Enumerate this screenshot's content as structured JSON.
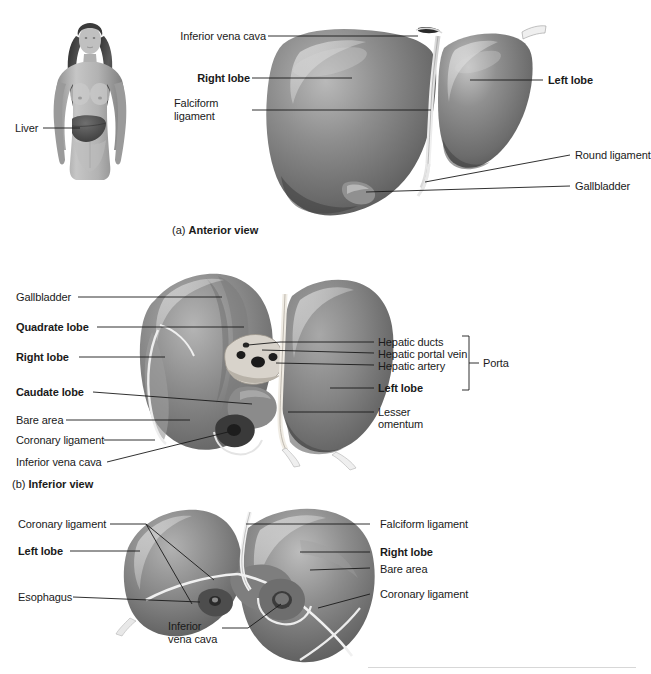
{
  "document": {
    "title": "Liver anatomy figure",
    "subject": "liver"
  },
  "panels": [
    {
      "id": "a",
      "caption_prefix": "(a)",
      "caption_title": "Anterior view",
      "orientation_figure": {
        "name": "human-body-silhouette",
        "label": "Liver"
      },
      "labels": [
        {
          "text": "Inferior vena cava",
          "bold": false,
          "align": "right"
        },
        {
          "text": "Right lobe",
          "bold": true,
          "align": "right"
        },
        {
          "text": "Falciform\nligament",
          "bold": false,
          "align": "left"
        },
        {
          "text": "Left lobe",
          "bold": true,
          "align": "left"
        },
        {
          "text": "Round ligament",
          "bold": false,
          "align": "left"
        },
        {
          "text": "Gallbladder",
          "bold": false,
          "align": "left"
        }
      ]
    },
    {
      "id": "b",
      "caption_prefix": "(b)",
      "caption_title": "Inferior view",
      "labels": [
        {
          "text": "Gallbladder",
          "bold": false,
          "align": "left"
        },
        {
          "text": "Quadrate lobe",
          "bold": true,
          "align": "left"
        },
        {
          "text": "Right lobe",
          "bold": true,
          "align": "left"
        },
        {
          "text": "Caudate lobe",
          "bold": true,
          "align": "left"
        },
        {
          "text": "Bare area",
          "bold": false,
          "align": "left"
        },
        {
          "text": "Coronary ligament",
          "bold": false,
          "align": "left"
        },
        {
          "text": "Inferior vena cava",
          "bold": false,
          "align": "left"
        },
        {
          "text": "Hepatic ducts",
          "bold": false,
          "align": "left"
        },
        {
          "text": "Hepatic portal vein",
          "bold": false,
          "align": "left"
        },
        {
          "text": "Hepatic artery",
          "bold": false,
          "align": "left"
        },
        {
          "text": "Left lobe",
          "bold": true,
          "align": "left"
        },
        {
          "text": "Lesser\nomentum",
          "bold": false,
          "align": "left"
        }
      ],
      "bracket_label": "Porta"
    },
    {
      "id": "c",
      "caption_prefix": "",
      "caption_title": "",
      "labels": [
        {
          "text": "Coronary ligament",
          "bold": false,
          "align": "left"
        },
        {
          "text": "Left lobe",
          "bold": true,
          "align": "left"
        },
        {
          "text": "Esophagus",
          "bold": false,
          "align": "left"
        },
        {
          "text": "Inferior\nvena cava",
          "bold": false,
          "align": "left"
        },
        {
          "text": "Falciform ligament",
          "bold": false,
          "align": "left"
        },
        {
          "text": "Right lobe",
          "bold": true,
          "align": "left"
        },
        {
          "text": "Bare area",
          "bold": false,
          "align": "left"
        },
        {
          "text": "Coronary ligament",
          "bold": false,
          "align": "left"
        }
      ]
    }
  ],
  "panel_a": {
    "label_inferior_vena_cava": "Inferior vena cava",
    "label_right_lobe": "Right lobe",
    "label_falciform_line1": "Falciform",
    "label_falciform_line2": "ligament",
    "label_left_lobe": "Left lobe",
    "label_round_ligament": "Round ligament",
    "label_gallbladder": "Gallbladder",
    "label_body_liver": "Liver",
    "caption_prefix": "(a) ",
    "caption_title": "Anterior view"
  },
  "panel_b": {
    "label_gallbladder": "Gallbladder",
    "label_quadrate_lobe": "Quadrate lobe",
    "label_right_lobe": "Right lobe",
    "label_caudate_lobe": "Caudate lobe",
    "label_bare_area": "Bare area",
    "label_coronary_ligament": "Coronary ligament",
    "label_inferior_vena_cava": "Inferior vena cava",
    "label_hepatic_ducts": "Hepatic ducts",
    "label_hepatic_portal_vein": "Hepatic portal vein",
    "label_hepatic_artery": "Hepatic artery",
    "label_porta": "Porta",
    "label_left_lobe": "Left lobe",
    "label_lesser_line1": "Lesser",
    "label_lesser_line2": "omentum",
    "caption_prefix": "(b) ",
    "caption_title": "Inferior view"
  },
  "panel_c": {
    "label_coronary_ligament_left": "Coronary ligament",
    "label_left_lobe": "Left lobe",
    "label_esophagus": "Esophagus",
    "label_inferior_line1": "Inferior",
    "label_inferior_line2": "vena cava",
    "label_falciform_ligament": "Falciform ligament",
    "label_right_lobe": "Right lobe",
    "label_bare_area": "Bare area",
    "label_coronary_ligament_right": "Coronary ligament"
  },
  "colors": {
    "background": "#ffffff",
    "text": "#1a1a1a",
    "leader_line": "#1a1a1a",
    "organ_mid": "#8a8a8a",
    "organ_dark": "#4a4a4a",
    "organ_light": "#c9c9c9",
    "footer_rule": "#d7d7d7"
  }
}
